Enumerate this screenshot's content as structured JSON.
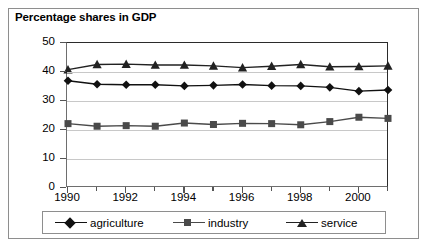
{
  "chart_data": {
    "type": "line",
    "title": "Percentage shares in GDP",
    "xlabel": "",
    "ylabel": "",
    "ylim": [
      0,
      50
    ],
    "ytick_labels": [
      "0",
      "10",
      "20",
      "30",
      "40",
      "50"
    ],
    "ytick_values": [
      0,
      10,
      20,
      30,
      40,
      50
    ],
    "grid": true,
    "grid_axis": "y",
    "legend_position": "bottom",
    "x": [
      1990,
      1991,
      1992,
      1993,
      1994,
      1995,
      1996,
      1997,
      1998,
      1999,
      2000,
      2001
    ],
    "categories": [
      "1990",
      "1991",
      "1992",
      "1993",
      "1994",
      "1995",
      "1996",
      "1997",
      "1998",
      "1999",
      "2000",
      "2001"
    ],
    "xtick_labels_shown": [
      "1990",
      "1992",
      "1994",
      "1996",
      "1998",
      "2000"
    ],
    "series": [
      {
        "name": "agriculture",
        "marker": "diamond",
        "color": "#111111",
        "values": [
          37.0,
          35.8,
          35.6,
          35.6,
          35.2,
          35.4,
          35.7,
          35.3,
          35.2,
          34.7,
          33.4,
          33.8
        ]
      },
      {
        "name": "industry",
        "marker": "square",
        "color": "#4a4a4a",
        "values": [
          22.2,
          21.3,
          21.5,
          21.3,
          22.4,
          21.9,
          22.3,
          22.2,
          21.8,
          22.9,
          24.4,
          24.0
        ]
      },
      {
        "name": "service",
        "marker": "triangle",
        "color": "#222222",
        "values": [
          40.8,
          42.6,
          42.7,
          42.4,
          42.4,
          42.1,
          41.5,
          42.0,
          42.6,
          41.8,
          41.9,
          42.1
        ]
      }
    ]
  }
}
